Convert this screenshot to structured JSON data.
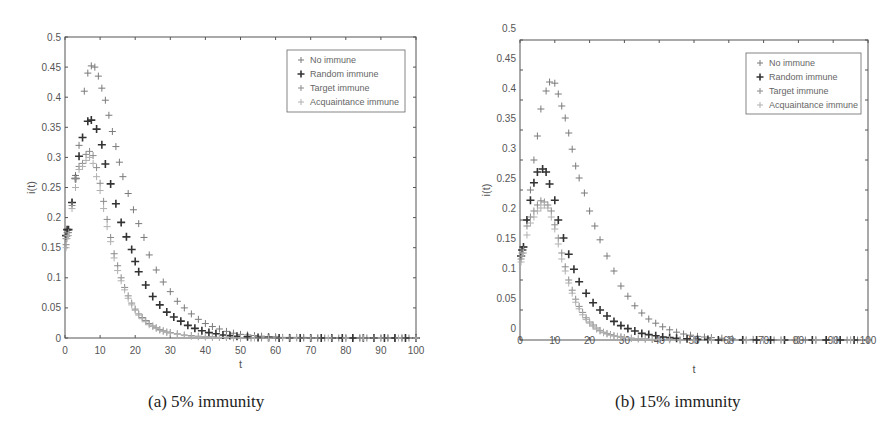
{
  "captions": {
    "a": "(a) 5% immunity",
    "b": "(b) 15% immunity"
  },
  "chart_data": [
    {
      "type": "scatter",
      "title": "(a) 5% immunity",
      "xlabel": "t",
      "ylabel": "i(t)",
      "xlim": [
        0,
        100
      ],
      "ylim": [
        0,
        0.5
      ],
      "xticks": [
        0,
        10,
        20,
        30,
        40,
        50,
        60,
        70,
        80,
        90,
        100
      ],
      "yticks": [
        0,
        0.05,
        0.1,
        0.15,
        0.2,
        0.25,
        0.3,
        0.35,
        0.4,
        0.45,
        0.5
      ],
      "ytick_labels": [
        "0",
        "0.05",
        "0.1",
        "0.15",
        "0.2",
        "0.25",
        "0.3",
        "0.35",
        "0.4",
        "0.45",
        "0.5"
      ],
      "xtick_labels": [
        "0",
        "10",
        "20",
        "30",
        "40",
        "50",
        "60",
        "70",
        "80",
        "90",
        "100"
      ],
      "grid": false,
      "legend_position": "upper right",
      "marker": "+",
      "series": [
        {
          "name": "No immune",
          "color": "#7a7a7a",
          "weight": "normal",
          "x": [
            0.3,
            0.6,
            1,
            2,
            3,
            4,
            5.5,
            6.5,
            7.5,
            8.5,
            9.5,
            10.5,
            11.5,
            12.5,
            13.5,
            14.5,
            15.5,
            16.5,
            18,
            19.5,
            21,
            22.5,
            24,
            26,
            28,
            30,
            32,
            34,
            36,
            38,
            40,
            42,
            44,
            46,
            48,
            50,
            52,
            54,
            56,
            58,
            60,
            62,
            64,
            66,
            68,
            70,
            72,
            74,
            76,
            78,
            80,
            82,
            84,
            86,
            88,
            90,
            92,
            94,
            96,
            98,
            100
          ],
          "y": [
            0.165,
            0.175,
            0.18,
            0.225,
            0.27,
            0.32,
            0.41,
            0.44,
            0.452,
            0.45,
            0.435,
            0.415,
            0.395,
            0.37,
            0.343,
            0.318,
            0.292,
            0.268,
            0.24,
            0.213,
            0.19,
            0.167,
            0.138,
            0.113,
            0.093,
            0.077,
            0.061,
            0.05,
            0.04,
            0.031,
            0.024,
            0.019,
            0.015,
            0.011,
            0.008,
            0.006,
            0.005,
            0.004,
            0.003,
            0.002,
            0.002,
            0.001,
            0.001,
            0.001,
            0.001,
            0,
            0,
            0,
            0,
            0,
            0,
            0,
            0,
            0,
            0,
            0,
            0,
            0,
            0,
            0,
            0
          ]
        },
        {
          "name": "Random immune",
          "color": "#333333",
          "weight": "bold",
          "x": [
            0.3,
            0.6,
            1,
            2,
            3,
            4,
            5,
            6.5,
            7.5,
            9,
            10.5,
            11.5,
            13,
            14.5,
            16,
            17.5,
            19,
            20,
            21,
            23,
            25,
            27,
            29,
            31,
            33,
            35,
            37,
            39,
            41,
            43,
            45,
            47,
            49,
            52,
            55,
            58,
            61,
            64,
            67,
            70,
            73,
            76,
            79,
            82,
            85,
            88,
            91,
            94,
            97,
            100
          ],
          "y": [
            0.17,
            0.18,
            0.18,
            0.225,
            0.265,
            0.302,
            0.333,
            0.36,
            0.362,
            0.347,
            0.321,
            0.289,
            0.256,
            0.223,
            0.192,
            0.168,
            0.147,
            0.127,
            0.11,
            0.088,
            0.069,
            0.055,
            0.043,
            0.035,
            0.028,
            0.021,
            0.016,
            0.012,
            0.009,
            0.007,
            0.005,
            0.004,
            0.003,
            0.002,
            0.001,
            0.001,
            0,
            0,
            0,
            0,
            0,
            0,
            0,
            0,
            0,
            0,
            0,
            0,
            0,
            0
          ]
        },
        {
          "name": "Target immune",
          "color": "#8a8a8a",
          "weight": "normal",
          "x": [
            0.3,
            0.6,
            1,
            2,
            3,
            4,
            5,
            6,
            7,
            8,
            9,
            10,
            11,
            12,
            13,
            14,
            15,
            16,
            17,
            18,
            19,
            20,
            21,
            22,
            23,
            24,
            25,
            26,
            27,
            28,
            29,
            30,
            32,
            34,
            36,
            38,
            40,
            42,
            44,
            46,
            48,
            50,
            53,
            56,
            60,
            64,
            68,
            72,
            76,
            80,
            84,
            88,
            92,
            96,
            100
          ],
          "y": [
            0.155,
            0.17,
            0.175,
            0.22,
            0.265,
            0.285,
            0.29,
            0.305,
            0.31,
            0.303,
            0.283,
            0.257,
            0.227,
            0.197,
            0.167,
            0.14,
            0.12,
            0.1,
            0.084,
            0.07,
            0.058,
            0.048,
            0.04,
            0.034,
            0.029,
            0.024,
            0.02,
            0.017,
            0.014,
            0.012,
            0.01,
            0.009,
            0.007,
            0.005,
            0.004,
            0.003,
            0.002,
            0.002,
            0.001,
            0.001,
            0.001,
            0,
            0,
            0,
            0,
            0,
            0,
            0,
            0,
            0,
            0,
            0,
            0,
            0,
            0
          ]
        },
        {
          "name": "Acquaintance immune",
          "color": "#b0b0b0",
          "weight": "normal",
          "x": [
            0.3,
            0.6,
            1,
            2,
            3,
            4,
            5,
            6,
            7,
            8,
            9,
            10,
            11,
            12,
            13,
            14,
            15,
            16,
            17,
            18,
            19,
            20,
            21,
            22,
            23,
            24,
            25,
            26,
            27,
            28,
            29,
            30,
            32,
            34,
            36,
            38,
            40,
            42,
            44,
            46,
            48,
            50,
            54,
            58,
            62,
            66,
            70,
            75,
            80,
            85,
            90,
            95,
            100
          ],
          "y": [
            0.15,
            0.165,
            0.17,
            0.215,
            0.25,
            0.28,
            0.285,
            0.295,
            0.3,
            0.29,
            0.268,
            0.245,
            0.215,
            0.185,
            0.16,
            0.133,
            0.112,
            0.095,
            0.08,
            0.066,
            0.055,
            0.046,
            0.038,
            0.032,
            0.027,
            0.022,
            0.019,
            0.016,
            0.013,
            0.011,
            0.009,
            0.008,
            0.006,
            0.004,
            0.003,
            0.002,
            0.002,
            0.001,
            0.001,
            0.001,
            0,
            0,
            0,
            0,
            0,
            0,
            0,
            0,
            0,
            0,
            0,
            0,
            0
          ]
        }
      ]
    },
    {
      "type": "scatter",
      "title": "(b) 15% immunity",
      "xlabel": "t",
      "ylabel": "i(t)",
      "xlim": [
        0,
        100
      ],
      "ylim": [
        0,
        0.5
      ],
      "xticks": [
        0,
        10,
        20,
        30,
        40,
        50,
        60,
        70,
        80,
        90,
        100
      ],
      "yticks": [
        0,
        0.05,
        0.1,
        0.15,
        0.2,
        0.25,
        0.3,
        0.35,
        0.4,
        0.45,
        0.5
      ],
      "ytick_labels": [
        "0",
        "0.05",
        "0.1",
        "0.15",
        "0.2",
        "0.25",
        "0.3",
        "0.35",
        "0.4",
        "0.45",
        "0.5"
      ],
      "xtick_labels": [
        "0",
        "10",
        "20",
        "30",
        "40",
        "50",
        "60",
        "70",
        "80",
        "90",
        "100"
      ],
      "grid": false,
      "legend_position": "upper right",
      "marker": "+",
      "series": [
        {
          "name": "No immune",
          "color": "#7a7a7a",
          "weight": "normal",
          "x": [
            0.3,
            0.6,
            1,
            2,
            3,
            4,
            5,
            6,
            7.5,
            8.5,
            10,
            11,
            12,
            13,
            14,
            15,
            16,
            17,
            18.5,
            20,
            21.5,
            23,
            25,
            27,
            29,
            31,
            33,
            35,
            37,
            39,
            41,
            43,
            45,
            47,
            49,
            51,
            53,
            55,
            58,
            61,
            64,
            67,
            70,
            73,
            76,
            79,
            82,
            85,
            88,
            91,
            94,
            97,
            100
          ],
          "y": [
            0.14,
            0.15,
            0.155,
            0.2,
            0.25,
            0.3,
            0.34,
            0.385,
            0.415,
            0.43,
            0.428,
            0.41,
            0.39,
            0.37,
            0.345,
            0.318,
            0.29,
            0.27,
            0.245,
            0.215,
            0.19,
            0.167,
            0.14,
            0.115,
            0.09,
            0.073,
            0.057,
            0.045,
            0.035,
            0.028,
            0.022,
            0.017,
            0.013,
            0.01,
            0.008,
            0.006,
            0.005,
            0.004,
            0.003,
            0.002,
            0.001,
            0.001,
            0.001,
            0,
            0,
            0,
            0,
            0,
            0,
            0,
            0,
            0,
            0
          ]
        },
        {
          "name": "Random immune",
          "color": "#333333",
          "weight": "bold",
          "x": [
            0.3,
            0.6,
            1,
            2,
            3,
            4,
            5,
            6.5,
            7.5,
            8.5,
            10,
            11,
            12.5,
            14,
            15.5,
            17,
            19,
            21,
            23,
            25,
            27,
            29,
            31,
            33,
            35,
            37,
            39,
            41,
            43,
            45,
            48,
            51,
            54,
            57,
            60,
            64,
            68,
            72,
            76,
            80,
            84,
            88,
            92,
            96,
            100
          ],
          "y": [
            0.14,
            0.15,
            0.155,
            0.2,
            0.233,
            0.262,
            0.28,
            0.285,
            0.28,
            0.26,
            0.233,
            0.2,
            0.17,
            0.143,
            0.118,
            0.097,
            0.078,
            0.062,
            0.05,
            0.04,
            0.031,
            0.024,
            0.019,
            0.015,
            0.011,
            0.009,
            0.007,
            0.005,
            0.004,
            0.003,
            0.002,
            0.001,
            0.001,
            0,
            0,
            0,
            0,
            0,
            0,
            0,
            0,
            0,
            0,
            0,
            0
          ]
        },
        {
          "name": "Target immune",
          "color": "#8a8a8a",
          "weight": "normal",
          "x": [
            0.3,
            0.6,
            1,
            2,
            3,
            4,
            5,
            6,
            7,
            8,
            9,
            10,
            11,
            12,
            13,
            14,
            15,
            16,
            17,
            18,
            19,
            20,
            21,
            22,
            23,
            24,
            25,
            26,
            27,
            28,
            29,
            30,
            32,
            34,
            36,
            38,
            40,
            43,
            46,
            50,
            55,
            60,
            65,
            70,
            75,
            80,
            85,
            90,
            95,
            100
          ],
          "y": [
            0.135,
            0.145,
            0.15,
            0.19,
            0.205,
            0.215,
            0.225,
            0.232,
            0.23,
            0.225,
            0.215,
            0.192,
            0.17,
            0.145,
            0.122,
            0.1,
            0.083,
            0.068,
            0.056,
            0.046,
            0.037,
            0.03,
            0.025,
            0.02,
            0.016,
            0.013,
            0.011,
            0.009,
            0.007,
            0.006,
            0.005,
            0.004,
            0.003,
            0.002,
            0.002,
            0.001,
            0.001,
            0.001,
            0,
            0,
            0,
            0,
            0,
            0,
            0,
            0,
            0,
            0,
            0,
            0
          ]
        },
        {
          "name": "Acquaintance immune",
          "color": "#b0b0b0",
          "weight": "normal",
          "x": [
            0.3,
            0.6,
            1,
            2,
            3,
            4,
            5,
            6,
            7,
            8,
            9,
            10,
            11,
            12,
            13,
            14,
            15,
            16,
            17,
            18,
            19,
            20,
            21,
            22,
            23,
            24,
            25,
            26,
            27,
            28,
            29,
            30,
            32,
            34,
            36,
            38,
            40,
            43,
            46,
            50,
            55,
            60,
            65,
            70,
            75,
            80,
            85,
            90,
            95,
            100
          ],
          "y": [
            0.13,
            0.14,
            0.145,
            0.175,
            0.195,
            0.205,
            0.215,
            0.22,
            0.225,
            0.22,
            0.205,
            0.185,
            0.16,
            0.135,
            0.115,
            0.095,
            0.078,
            0.063,
            0.052,
            0.042,
            0.034,
            0.028,
            0.023,
            0.018,
            0.015,
            0.012,
            0.01,
            0.008,
            0.007,
            0.006,
            0.005,
            0.004,
            0.003,
            0.002,
            0.001,
            0.001,
            0.001,
            0,
            0,
            0,
            0,
            0,
            0,
            0,
            0,
            0,
            0,
            0,
            0,
            0
          ]
        }
      ]
    }
  ]
}
